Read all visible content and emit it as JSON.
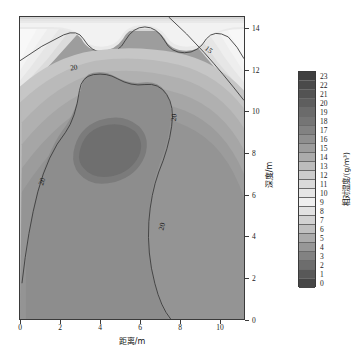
{
  "figure": {
    "background": "#ffffff",
    "frame_color": "#3a3a3a"
  },
  "chart_data": {
    "type": "heatmap",
    "subtype": "filled-contour",
    "title": "",
    "xlabel": "距离/m",
    "ylabel": "深度/m",
    "colorbar_label": "相对湿度/(g/m³)",
    "xlim": [
      0,
      11.3
    ],
    "ylim": [
      0,
      15.2
    ],
    "xticks": [
      0,
      2,
      4,
      6,
      8,
      10
    ],
    "xtick_labels": [
      "0",
      "2",
      "4",
      "6",
      "8",
      "10"
    ],
    "yticks": [
      0,
      2,
      4,
      6,
      8,
      10,
      12,
      14
    ],
    "ytick_labels": [
      "0",
      "2",
      "4",
      "6",
      "8",
      "10",
      "12",
      "14"
    ],
    "grid": false,
    "colormap": "gray-cyclic",
    "zlim": [
      0,
      23
    ],
    "levels": [
      0,
      1,
      2,
      3,
      4,
      5,
      6,
      7,
      8,
      9,
      10,
      11,
      12,
      13,
      14,
      15,
      16,
      17,
      18,
      19,
      20,
      21,
      22,
      23
    ],
    "colorbar_tick_labels": [
      "23",
      "22",
      "21",
      "20",
      "19",
      "18",
      "17",
      "16",
      "15",
      "14",
      "13",
      "12",
      "11",
      "10",
      "9",
      "8",
      "7",
      "6",
      "5",
      "4",
      "3",
      "2",
      "1",
      "0"
    ],
    "colorbar_colors": [
      "#3f3f3f",
      "#4a4a4a",
      "#535353",
      "#5e5e5e",
      "#6b6b6b",
      "#757575",
      "#828282",
      "#8f8f8f",
      "#9c9c9c",
      "#ababab",
      "#bcbcbc",
      "#cccccc",
      "#dadada",
      "#e6e6e6",
      "#efefef",
      "#e2e2e2",
      "#d2d2d2",
      "#c0c0c0",
      "#ababab",
      "#979797",
      "#828282",
      "#6d6d6d",
      "#585858",
      "#464646"
    ],
    "contour_lines": [
      {
        "level": 15,
        "label": "15"
      },
      {
        "level": 20,
        "label": "20"
      }
    ],
    "contour_label_color": "#1a1a1a",
    "annotations": [
      {
        "text": "20",
        "x_px": 78,
        "y_px": 68,
        "rotation": -8
      },
      {
        "text": "15",
        "x_px": 210,
        "y_px": 50,
        "rotation": 38
      },
      {
        "text": "20",
        "x_px": 174,
        "y_px": 118,
        "rotation": -82
      },
      {
        "text": "20",
        "x_px": 42,
        "y_px": 182,
        "rotation": -72
      },
      {
        "text": "20",
        "x_px": 162,
        "y_px": 227,
        "rotation": -76
      }
    ]
  }
}
